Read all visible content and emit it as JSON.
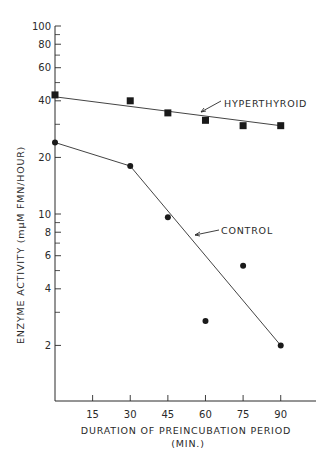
{
  "chart_data": {
    "type": "scatter",
    "title": "",
    "xlabel": "DURATION OF PREINCUBATION PERIOD",
    "xlabel_unit": "(MIN.)",
    "ylabel": "ENZYME ACTIVITY (mμM FMN/HOUR)",
    "yscale": "log",
    "xlim": [
      0,
      100
    ],
    "ylim": [
      1.2,
      100
    ],
    "x_ticks": [
      15,
      30,
      45,
      60,
      75,
      90
    ],
    "y_ticks_labeled": [
      2,
      4,
      6,
      8,
      10,
      20,
      40,
      60,
      80,
      100
    ],
    "y_ticks_minor": [
      3,
      5,
      7,
      9,
      30,
      50,
      70,
      90
    ],
    "grid": false,
    "legend": "inline labels with arrows",
    "series": [
      {
        "name": "HYPERTHYROID",
        "marker": "square",
        "x": [
          0,
          30,
          45,
          60,
          75,
          90
        ],
        "y": [
          43,
          40,
          34.5,
          31.5,
          29.5,
          29.5
        ],
        "fit_line": {
          "x": [
            0,
            90
          ],
          "y": [
            42,
            29.5
          ]
        }
      },
      {
        "name": "CONTROL",
        "marker": "circle",
        "x": [
          0,
          30,
          45,
          60,
          75,
          90
        ],
        "y": [
          24,
          18,
          9.6,
          2.7,
          5.3,
          2.0
        ],
        "fit_line": {
          "x": [
            0,
            30,
            90
          ],
          "y": [
            24,
            18,
            2.0
          ]
        }
      }
    ],
    "annotations": [
      {
        "text": "HYPERTHYROID",
        "arrow_to": "hyperthyroid line near x=50"
      },
      {
        "text": "CONTROL",
        "arrow_to": "control line near x=52"
      }
    ]
  },
  "layout": {
    "plot_left": 55,
    "plot_right": 316,
    "x_axis_y": 401,
    "y_axis_top": 26,
    "px_per_min": 2.508,
    "y10_px": 214,
    "px_per_decade": 188
  }
}
